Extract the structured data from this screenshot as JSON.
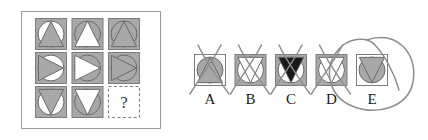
{
  "puzzle": {
    "type": "ravens-progressive-matrix",
    "question_mark": "?",
    "panel": {
      "background": "#ffffff",
      "border_color": "#9a9a9a"
    },
    "colors": {
      "gray_fill": "#a8a8a8",
      "white_fill": "#ffffff",
      "black_fill": "#1a1a1a",
      "stroke": "#6b6b6b",
      "cell_border": "#7d7d7d",
      "dashed_border": "#7d7d7d",
      "mark_color": "#8e8e8e",
      "label_color": "#1a1a1a"
    },
    "matrix": {
      "rows": 3,
      "cols": 3,
      "cells": [
        {
          "id": "r1c1",
          "square": "gray",
          "circle": "white",
          "triangle": "gray",
          "direction": "up",
          "empty": false
        },
        {
          "id": "r1c2",
          "square": "gray",
          "circle": "gray",
          "triangle": "white",
          "direction": "up",
          "empty": false
        },
        {
          "id": "r1c3",
          "square": "gray",
          "circle": "gray",
          "triangle": "gray",
          "direction": "up",
          "empty": false
        },
        {
          "id": "r2c1",
          "square": "gray",
          "circle": "white",
          "triangle": "gray",
          "direction": "right",
          "empty": false
        },
        {
          "id": "r2c2",
          "square": "gray",
          "circle": "gray",
          "triangle": "white",
          "direction": "right",
          "empty": false
        },
        {
          "id": "r2c3",
          "square": "gray",
          "circle": "gray",
          "triangle": "gray",
          "direction": "right",
          "empty": false
        },
        {
          "id": "r3c1",
          "square": "gray",
          "circle": "white",
          "triangle": "gray",
          "direction": "down",
          "empty": false
        },
        {
          "id": "r3c2",
          "square": "gray",
          "circle": "gray",
          "triangle": "white",
          "direction": "down",
          "empty": false
        },
        {
          "id": "r3c3",
          "square": "none",
          "circle": "none",
          "triangle": "none",
          "direction": "none",
          "empty": true
        }
      ]
    },
    "options": [
      {
        "label": "A",
        "square": "white",
        "circle": "gray",
        "triangle": "gray",
        "direction": "up",
        "marked": "cross",
        "selected": false
      },
      {
        "label": "B",
        "square": "gray",
        "circle": "white",
        "triangle": "white",
        "direction": "down",
        "marked": "cross",
        "selected": false
      },
      {
        "label": "C",
        "square": "gray",
        "circle": "white",
        "triangle": "black",
        "direction": "down",
        "marked": "cross",
        "selected": false
      },
      {
        "label": "D",
        "square": "gray",
        "circle": "white",
        "triangle": "white",
        "direction": "down",
        "marked": "cross",
        "selected": false
      },
      {
        "label": "E",
        "square": "white",
        "circle": "gray",
        "triangle": "gray",
        "direction": "down",
        "marked": "circle",
        "selected": true
      }
    ]
  }
}
